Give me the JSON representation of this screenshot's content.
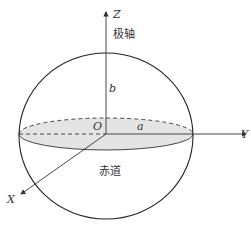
{
  "diagram": {
    "type": "ellipsoid-coordinate-system",
    "axes": {
      "z_label": "Z",
      "y_label": "Y",
      "x_label": "X"
    },
    "labels": {
      "origin": "O",
      "semi_major": "a",
      "semi_minor": "b",
      "polar_axis": "极轴",
      "equator": "赤道"
    },
    "colors": {
      "stroke": "#333333",
      "equator_fill": "#e4e4e4",
      "background": "#ffffff"
    }
  }
}
